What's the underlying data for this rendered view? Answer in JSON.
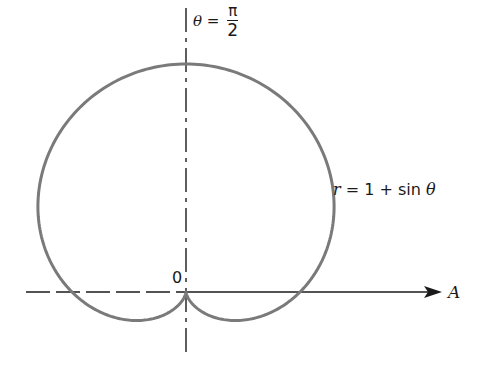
{
  "diagram": {
    "curve_label": {
      "r": "r",
      "eq": " = 1 + sin ",
      "theta": "θ"
    },
    "vertical_axis_label": {
      "theta": "θ",
      "eq": " = ",
      "num": "π",
      "den": "2"
    },
    "origin_label": "0",
    "polar_axis_label": "A",
    "colors": {
      "curve": "#7a7a7a",
      "axis": "#1a1a1a",
      "text": "#1a1a1a"
    },
    "geometry": {
      "origin_x": 186,
      "origin_y": 292,
      "scale_a": 114,
      "curve_width": 3
    }
  },
  "chart_data": {
    "type": "line",
    "title": "",
    "equation": "r = 1 + sin θ",
    "coordinate_system": "polar",
    "annotations": [
      "θ = π/2",
      "0",
      "A",
      "r = 1 + sin θ"
    ],
    "x": [
      0,
      0.5236,
      1.0472,
      1.5708,
      2.0944,
      2.618,
      3.1416,
      3.6652,
      4.1888,
      4.7124,
      5.236,
      5.7596,
      6.2832
    ],
    "values": [
      1.0,
      1.5,
      1.866,
      2.0,
      1.866,
      1.5,
      1.0,
      0.5,
      0.134,
      0.0,
      0.134,
      0.5,
      1.0
    ],
    "xlabel": "θ (radians)",
    "ylabel": "r",
    "grid": false
  }
}
